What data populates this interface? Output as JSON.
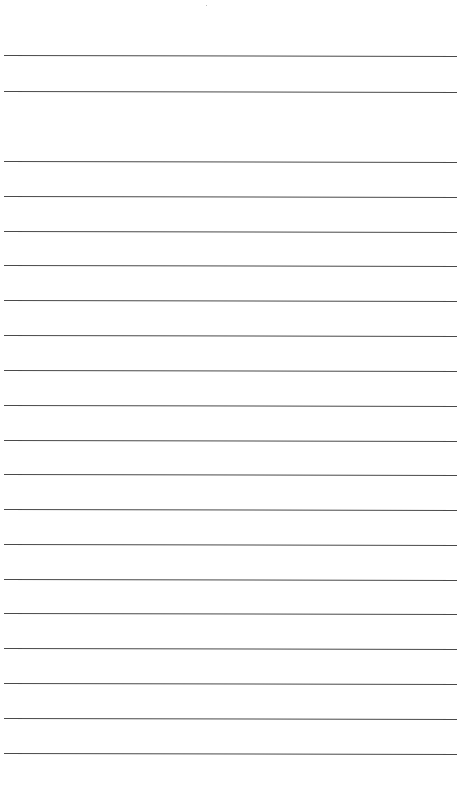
{
  "page": {
    "type": "blank-lined-sheet",
    "background_color": "#ffffff",
    "rule_color": "#4a4a4a",
    "header_rules_y": [
      55,
      91
    ],
    "body_rules_y": [
      161,
      196,
      231,
      265,
      300,
      335,
      370,
      405,
      440,
      474,
      509,
      544,
      579,
      613,
      648,
      683,
      718,
      753
    ],
    "rule_x_start": 4,
    "rule_x_end": 457
  }
}
